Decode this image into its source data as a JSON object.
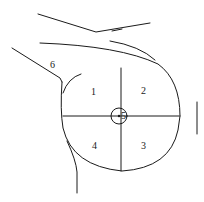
{
  "diagram": {
    "type": "breast-quadrant-diagram",
    "labels": {
      "q1": "1",
      "q2": "2",
      "q3": "3",
      "q4": "4",
      "center": "5",
      "axilla": "6"
    },
    "colors": {
      "line": "#1a1a1a",
      "background": "#ffffff"
    }
  }
}
